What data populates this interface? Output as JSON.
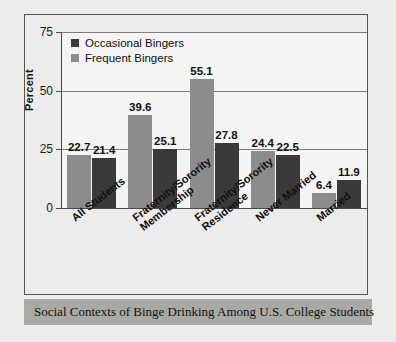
{
  "figure": {
    "caption": "Social Contexts of Binge Drinking Among U.S. College Students"
  },
  "colors": {
    "occasional": "#3a3a3a",
    "frequent": "#8c8c8c",
    "axis": "#4a4a4a",
    "grid": "#7d7d7d",
    "caption_band": "#a9a9a6",
    "plot_background": "#f4f4f2",
    "frame_background": "#ececea"
  },
  "legend": {
    "position": "top-left-inside",
    "entries": [
      {
        "label": "Occasional Bingers",
        "color_key": "occasional"
      },
      {
        "label": "Frequent Bingers",
        "color_key": "frequent"
      }
    ]
  },
  "axes": {
    "ylabel": "Percent",
    "yticks": [
      "0",
      "25",
      "50",
      "75"
    ],
    "ylim": [
      0,
      75
    ]
  },
  "chart_data": {
    "type": "bar",
    "title": "Social Contexts of Binge Drinking Among U.S. College Students",
    "xlabel": "",
    "ylabel": "Percent",
    "ylim": [
      0,
      75
    ],
    "yticks": [
      0,
      25,
      50,
      75
    ],
    "grid": true,
    "legend_position": "upper left (inside plot)",
    "categories": [
      "All Students",
      "Fraternity/Sorority\nMembership",
      "Fraternity/Sorority\nResidence",
      "Never Married",
      "Married"
    ],
    "series": [
      {
        "name": "Frequent Bingers",
        "color": "#8c8c8c",
        "values": [
          22.7,
          39.6,
          55.1,
          24.4,
          6.4
        ]
      },
      {
        "name": "Occasional Bingers",
        "color": "#3a3a3a",
        "values": [
          21.4,
          25.1,
          27.8,
          22.5,
          11.9
        ]
      }
    ]
  }
}
